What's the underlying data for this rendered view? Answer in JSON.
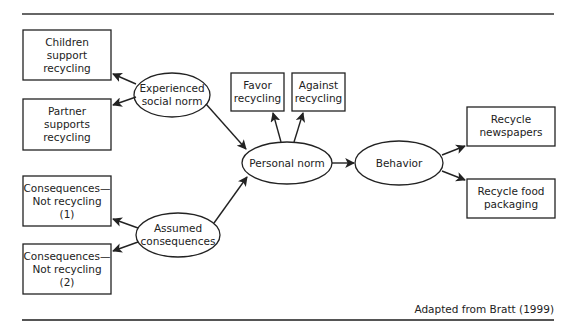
{
  "diagram": {
    "caption": "Adapted from Bratt (1999)",
    "colors": {
      "stroke": "#222222",
      "rule": "#555555",
      "background": "#ffffff"
    },
    "nodes": {
      "children": {
        "shape": "box",
        "lines": [
          "Children",
          "support",
          "recycling"
        ]
      },
      "partner": {
        "shape": "box",
        "lines": [
          "Partner",
          "supports",
          "recycling"
        ]
      },
      "experienced": {
        "shape": "ellipse",
        "lines": [
          "Experienced",
          "social norm"
        ]
      },
      "favor": {
        "shape": "box",
        "lines": [
          "Favor",
          "recycling"
        ]
      },
      "against": {
        "shape": "box",
        "lines": [
          "Against",
          "recycling"
        ]
      },
      "personal": {
        "shape": "ellipse",
        "lines": [
          "Personal norm"
        ]
      },
      "behavior": {
        "shape": "ellipse",
        "lines": [
          "Behavior"
        ]
      },
      "newspapers": {
        "shape": "box",
        "lines": [
          "Recycle",
          "newspapers"
        ]
      },
      "food": {
        "shape": "box",
        "lines": [
          "Recycle food",
          "packaging"
        ]
      },
      "conseq1": {
        "shape": "box",
        "lines": [
          "Consequences—",
          "Not recycling",
          "(1)"
        ]
      },
      "conseq2": {
        "shape": "box",
        "lines": [
          "Consequences—",
          "Not recycling",
          "(2)"
        ]
      },
      "assumed": {
        "shape": "ellipse",
        "lines": [
          "Assumed",
          "consequences"
        ]
      }
    },
    "edges": [
      {
        "from": "experienced",
        "to": "children"
      },
      {
        "from": "experienced",
        "to": "partner"
      },
      {
        "from": "experienced",
        "to": "personal"
      },
      {
        "from": "assumed",
        "to": "conseq1"
      },
      {
        "from": "assumed",
        "to": "conseq2"
      },
      {
        "from": "assumed",
        "to": "personal"
      },
      {
        "from": "personal",
        "to": "favor"
      },
      {
        "from": "personal",
        "to": "against"
      },
      {
        "from": "personal",
        "to": "behavior"
      },
      {
        "from": "behavior",
        "to": "newspapers"
      },
      {
        "from": "behavior",
        "to": "food"
      }
    ]
  }
}
